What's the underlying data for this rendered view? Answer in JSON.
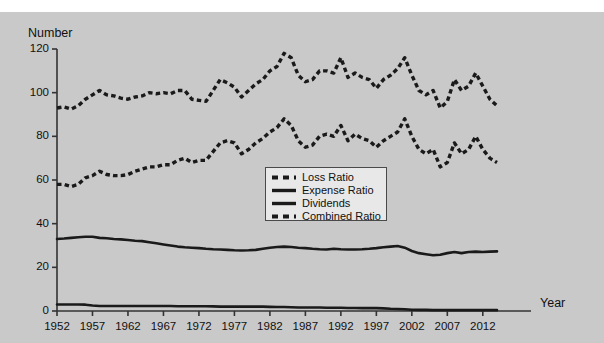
{
  "chart_data": {
    "type": "line",
    "title": "",
    "xlabel": "Year",
    "ylabel": "Number",
    "xlim": [
      1952,
      2014
    ],
    "ylim": [
      0,
      120
    ],
    "grid": false,
    "legend_position": "center-right-inside",
    "xticks": [
      1952,
      1957,
      1962,
      1967,
      1972,
      1977,
      1982,
      1987,
      1992,
      1997,
      2002,
      2007,
      2012
    ],
    "yticks": [
      0,
      20,
      40,
      60,
      80,
      100,
      120
    ],
    "x": [
      1952,
      1953,
      1954,
      1955,
      1956,
      1957,
      1958,
      1959,
      1960,
      1961,
      1962,
      1963,
      1964,
      1965,
      1966,
      1967,
      1968,
      1969,
      1970,
      1971,
      1972,
      1973,
      1974,
      1975,
      1976,
      1977,
      1978,
      1979,
      1980,
      1981,
      1982,
      1983,
      1984,
      1985,
      1986,
      1987,
      1988,
      1989,
      1990,
      1991,
      1992,
      1993,
      1994,
      1995,
      1996,
      1997,
      1998,
      1999,
      2000,
      2001,
      2002,
      2003,
      2004,
      2005,
      2006,
      2007,
      2008,
      2009,
      2010,
      2011,
      2012,
      2013,
      2014
    ],
    "series": [
      {
        "name": "Combined Ratio",
        "style": "dashed",
        "color": "#1a1a1a",
        "values": [
          93,
          93.5,
          92.5,
          94,
          97,
          99,
          101,
          99,
          98.5,
          97.5,
          97,
          98,
          98.5,
          100,
          99.5,
          100,
          99.5,
          101,
          101,
          97,
          96.5,
          96,
          101,
          106,
          104.5,
          102.5,
          98,
          101,
          104,
          106,
          110,
          112,
          118,
          116,
          108,
          105,
          106,
          110,
          110,
          109,
          116,
          107,
          109,
          107,
          106,
          102,
          106,
          108,
          111,
          116,
          108,
          101,
          99,
          101,
          93,
          96,
          106,
          101,
          103,
          109,
          103,
          97,
          94
        ]
      },
      {
        "name": "Loss Ratio",
        "style": "dashed",
        "color": "#1a1a1a",
        "values": [
          58,
          58,
          57,
          58,
          61,
          62,
          64,
          62.5,
          62,
          62,
          62.5,
          64,
          65,
          66,
          66,
          67,
          67,
          69,
          70,
          68,
          69,
          69,
          73,
          77,
          78,
          77,
          72,
          74,
          77,
          79,
          82,
          84,
          88,
          85,
          78,
          75,
          76,
          80,
          81,
          80,
          85,
          78,
          81,
          79,
          78,
          75,
          78,
          80,
          82,
          88,
          80,
          74,
          72,
          74,
          66,
          68,
          77,
          72,
          74,
          80,
          74,
          70,
          68
        ]
      },
      {
        "name": "Expense Ratio",
        "style": "solid",
        "color": "#1a1a1a",
        "values": [
          33,
          33.2,
          33.5,
          33.8,
          34,
          34,
          33.5,
          33.3,
          33,
          32.8,
          32.5,
          32.2,
          32,
          31.5,
          31,
          30.5,
          30,
          29.5,
          29.2,
          29,
          28.8,
          28.5,
          28.3,
          28.2,
          28,
          27.8,
          27.7,
          27.8,
          28,
          28.5,
          29,
          29.3,
          29.5,
          29.3,
          29,
          28.8,
          28.5,
          28.3,
          28.2,
          28.5,
          28.3,
          28.2,
          28.2,
          28.3,
          28.5,
          28.8,
          29.2,
          29.5,
          29.8,
          29,
          27.5,
          26.5,
          26,
          25.5,
          25.8,
          26.5,
          27,
          26.5,
          27,
          27.2,
          27,
          27.2,
          27.3
        ]
      },
      {
        "name": "Dividends",
        "style": "solid",
        "color": "#1a1a1a",
        "values": [
          3,
          3,
          3,
          3,
          2.9,
          2.5,
          2.3,
          2.3,
          2.3,
          2.3,
          2.3,
          2.3,
          2.3,
          2.3,
          2.3,
          2.3,
          2.3,
          2.2,
          2.2,
          2.2,
          2.2,
          2.2,
          2.1,
          2,
          2,
          2,
          2,
          2,
          2,
          2,
          1.9,
          1.8,
          1.8,
          1.7,
          1.6,
          1.6,
          1.6,
          1.6,
          1.5,
          1.5,
          1.5,
          1.4,
          1.4,
          1.3,
          1.3,
          1.3,
          1.2,
          1,
          0.9,
          0.8,
          0.6,
          0.5,
          0.5,
          0.4,
          0.4,
          0.4,
          0.4,
          0.4,
          0.4,
          0.4,
          0.4,
          0.4,
          0.4
        ]
      }
    ],
    "legend": [
      {
        "label": "Loss Ratio",
        "style": "dashed"
      },
      {
        "label": "Expense Ratio",
        "style": "solid"
      },
      {
        "label": "Dividends",
        "style": "solid"
      },
      {
        "label": "Combined Ratio",
        "style": "dashed"
      }
    ]
  },
  "colors": {
    "background": "#c9c9c9",
    "line": "#1a1a1a",
    "axis": "#333333",
    "legend_bg": "#e8e8e8",
    "legend_border": "#4a4a4a"
  }
}
